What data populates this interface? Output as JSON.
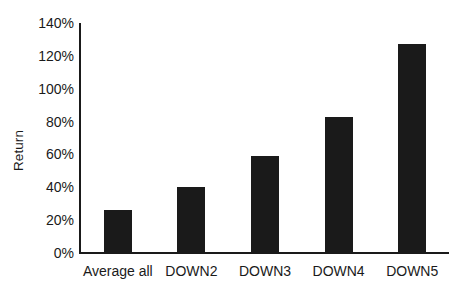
{
  "chart_data": {
    "type": "bar",
    "title": "",
    "subtitle": "",
    "xlabel": "",
    "ylabel": "Return",
    "categories": [
      "Average all",
      "DOWN2",
      "DOWN3",
      "DOWN4",
      "DOWN5"
    ],
    "values": [
      26,
      40,
      59,
      83,
      127
    ],
    "value_labels": [
      "26%",
      "40%",
      "59%",
      "83%",
      "127%"
    ],
    "series": [
      {
        "name": "Return",
        "values": [
          26,
          40,
          59,
          83,
          127
        ]
      }
    ],
    "ylim": [
      0,
      140
    ],
    "ytick_values": [
      0,
      20,
      40,
      60,
      80,
      100,
      120,
      140
    ],
    "ytick_labels": [
      "0%",
      "20%",
      "40%",
      "60%",
      "80%",
      "100%",
      "120%",
      "140%"
    ],
    "grid": false,
    "legend": false,
    "legend_position": "none",
    "bar_color": "#1a1a1a",
    "background_color": "#ffffff",
    "axis_color": "#1a1a1a"
  },
  "axes": {
    "y_title": "Return"
  }
}
